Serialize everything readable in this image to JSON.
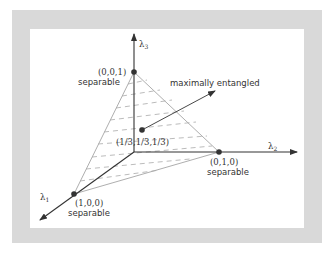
{
  "diagram": {
    "axes": {
      "x1": {
        "label": "λ",
        "sub": "1"
      },
      "x2": {
        "label": "λ",
        "sub": "2"
      },
      "x3": {
        "label": "λ",
        "sub": "3"
      }
    },
    "points": {
      "p001": {
        "coords": "(0,0,1)",
        "caption": "separable"
      },
      "p010": {
        "coords": "(0,1,0)",
        "caption": "separable"
      },
      "p100": {
        "coords": "(1,0,0)",
        "caption": "separable"
      },
      "center": {
        "coords": "(1/3,1/3,1/3)"
      }
    },
    "annotation": "maximally entangled",
    "colors": {
      "frame": "#d9d9d9",
      "axis": "#333333",
      "edge": "#999999",
      "dash": "#aaaaaa",
      "dot": "#333333"
    }
  }
}
